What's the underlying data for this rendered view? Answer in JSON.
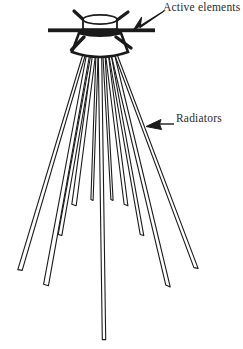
{
  "figure": {
    "kind": "antenna-line-drawing",
    "background_color": "#ffffff",
    "ink_color": "#1a1a1a",
    "text_color": "#2b2b2b"
  },
  "annotations": [
    {
      "id": "active-elements",
      "label": "Active elements",
      "arrow": "arrow-down-left-icon",
      "arrow_direction": "down-left",
      "points_to": "feed-assembly-bar"
    },
    {
      "id": "radiators",
      "label": "Radiators",
      "arrow": "arrow-left-icon",
      "arrow_direction": "left",
      "points_to": "radiator-rod"
    }
  ],
  "structure": {
    "feed_cylinder": {
      "name": "feed-cylinder",
      "center_x": 100,
      "top_y": 18,
      "height": 13,
      "radius_x": 17,
      "rim_ry": 4
    },
    "horizontal_bar": {
      "name": "horizontal-bar",
      "x1": 48,
      "x2": 155,
      "y": 30,
      "thickness": 4
    },
    "body": {
      "name": "feed-body-trapezoid",
      "top_y": 33,
      "bottom_y": 58,
      "top_half_width": 21,
      "bottom_half_width": 28,
      "center_x": 100
    },
    "active_stubs": {
      "name": "active-element-stubs",
      "count": 4,
      "rods": [
        {
          "x1": 86,
          "y1": 22,
          "x2": 74,
          "y2": 11
        },
        {
          "x1": 114,
          "y1": 22,
          "x2": 128,
          "y2": 12
        },
        {
          "x1": 84,
          "y1": 38,
          "x2": 72,
          "y2": 50
        },
        {
          "x1": 116,
          "y1": 38,
          "x2": 131,
          "y2": 48
        }
      ]
    },
    "radiators": {
      "name": "radiator-rod-fan",
      "count": 11,
      "apex_y": 55,
      "rods": [
        {
          "x1": 84,
          "y1": 55,
          "x2": 20,
          "y2": 270,
          "w": 2.6
        },
        {
          "x1": 88,
          "y1": 55,
          "x2": 46,
          "y2": 285,
          "w": 3.2
        },
        {
          "x1": 92,
          "y1": 55,
          "x2": 60,
          "y2": 235,
          "w": 2.4
        },
        {
          "x1": 94,
          "y1": 55,
          "x2": 74,
          "y2": 205,
          "w": 3.0
        },
        {
          "x1": 97,
          "y1": 55,
          "x2": 92,
          "y2": 200,
          "w": 2.2
        },
        {
          "x1": 100,
          "y1": 55,
          "x2": 104,
          "y2": 340,
          "w": 3.4
        },
        {
          "x1": 104,
          "y1": 55,
          "x2": 112,
          "y2": 200,
          "w": 2.2
        },
        {
          "x1": 107,
          "y1": 55,
          "x2": 126,
          "y2": 205,
          "w": 2.8
        },
        {
          "x1": 110,
          "y1": 55,
          "x2": 142,
          "y2": 235,
          "w": 2.4
        },
        {
          "x1": 113,
          "y1": 55,
          "x2": 168,
          "y2": 286,
          "w": 3.2
        },
        {
          "x1": 116,
          "y1": 55,
          "x2": 196,
          "y2": 268,
          "w": 2.6
        }
      ]
    }
  }
}
